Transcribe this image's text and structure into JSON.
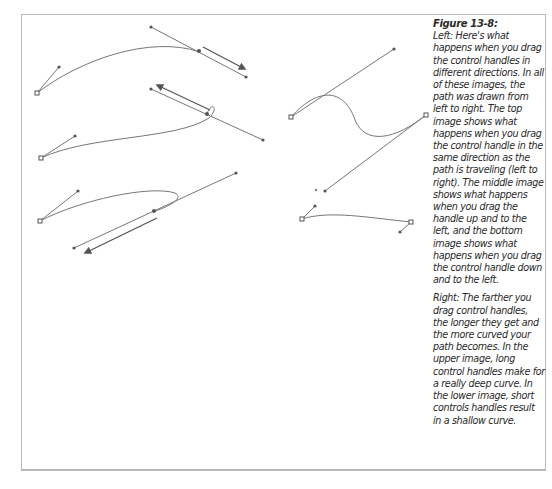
{
  "figure": {
    "title": "Figure 13-8:",
    "left_paragraph": "Left: Here's what happens when you drag the control handles in different directions. In all of these images, the path was drawn from left to right. The top image shows what happens when you drag the control handle in the same direction as the path is traveling (left to right). The middle image shows what happens when you drag the handle up and to the left, and the bottom image shows what happens when you drag the control handle down and to the left.",
    "right_paragraph": "Right: The farther you drag control handles, the longer they get and the more curved your path becomes. In the upper image, long control handles make for a really deep curve. In the lower image, short controls handles result in a shallow curve."
  },
  "illustrations": {
    "left": [
      {
        "name": "top",
        "description": "handle dragged in same direction as path (left to right)"
      },
      {
        "name": "middle",
        "description": "handle dragged up and to the left"
      },
      {
        "name": "bottom",
        "description": "handle dragged down and to the left"
      }
    ],
    "right": [
      {
        "name": "upper",
        "description": "long control handles, deep curve"
      },
      {
        "name": "lower",
        "description": "short control handles, shallow curve"
      }
    ]
  },
  "colors": {
    "frame": "#b8b8b8",
    "line": "#6e6e6e",
    "text": "#2a2a2a"
  }
}
